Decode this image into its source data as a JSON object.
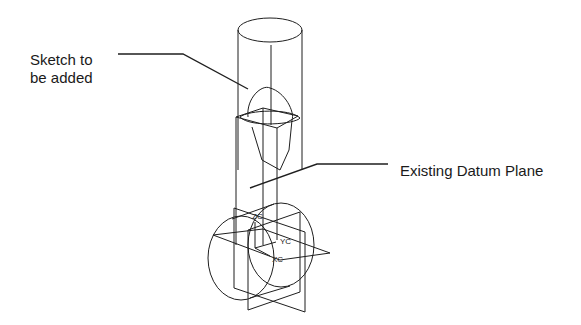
{
  "annotations": {
    "sketch_label": "Sketch to\nbe added",
    "datum_label": "Existing Datum Plane"
  },
  "axes": {
    "z": "ZC",
    "y": "YC",
    "x": "XC"
  },
  "colors": {
    "line": "#1f1f1f",
    "background": "#ffffff"
  }
}
